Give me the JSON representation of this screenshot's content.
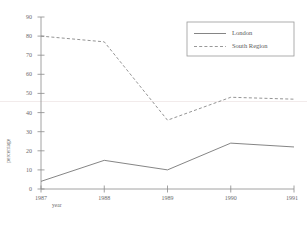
{
  "chart_data": {
    "type": "line",
    "title": "",
    "xlabel": "year",
    "ylabel": "percentage",
    "categories": [
      "1987",
      "1988",
      "1989",
      "1990",
      "1991"
    ],
    "x": [
      1987,
      1988,
      1989,
      1990,
      1991
    ],
    "xlim": [
      1987,
      1991
    ],
    "ylim": [
      0,
      90
    ],
    "yticks": [
      0,
      10,
      20,
      30,
      40,
      50,
      60,
      70,
      80,
      90
    ],
    "grid": false,
    "legend_position": "top-right",
    "series": [
      {
        "name": "London",
        "style": "solid",
        "color": "#777777",
        "values": [
          4,
          15,
          10,
          24,
          22
        ]
      },
      {
        "name": "South Region",
        "style": "dashed",
        "color": "#888888",
        "values": [
          80,
          77,
          36,
          48,
          47
        ]
      }
    ]
  },
  "axis": {
    "y_labels": [
      "90",
      "80",
      "70",
      "60",
      "50",
      "40",
      "30",
      "20",
      "10",
      "0"
    ],
    "x_labels": [
      "1987",
      "1988",
      "1989",
      "1990",
      "1991"
    ],
    "y_title": "percentage",
    "x_title": "year"
  },
  "legend": {
    "entries": [
      {
        "label": "London",
        "style": "solid"
      },
      {
        "label": "South Region",
        "style": "dashed"
      }
    ]
  },
  "colors": {
    "axis": "#8a8a8a",
    "london": "#777777",
    "south_region": "#8c8c8c",
    "gridline": "#e8e0e0",
    "text": "#6b6b6b",
    "background": "#ffffff"
  }
}
